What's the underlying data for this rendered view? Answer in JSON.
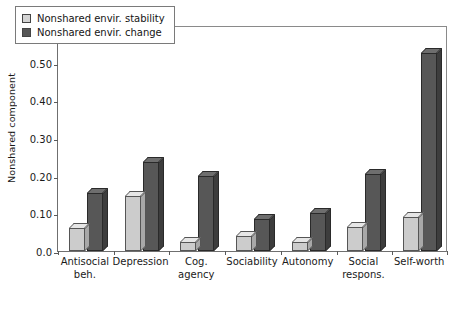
{
  "chart_data": {
    "type": "bar",
    "title": "",
    "xlabel": "",
    "ylabel": "Nonshared component",
    "ylim": [
      0.0,
      0.6
    ],
    "yticks": [
      "0.0",
      "0.10",
      "0.20",
      "0.30",
      "0.40",
      "0.50",
      "0.60"
    ],
    "ytick_values": [
      0.0,
      0.1,
      0.2,
      0.3,
      0.4,
      0.5,
      0.6
    ],
    "grid": false,
    "legend_position": "top-left",
    "categories": [
      "Antisocial beh.",
      "Depression",
      "Cog. agency",
      "Sociability",
      "Autonomy",
      "Social respons.",
      "Self-worth"
    ],
    "category_lines": [
      [
        "Antisocial",
        "beh."
      ],
      [
        "Depression",
        ""
      ],
      [
        "Cog.",
        "agency"
      ],
      [
        "Sociability",
        ""
      ],
      [
        "Autonomy",
        ""
      ],
      [
        "Social",
        "respons."
      ],
      [
        "Self-worth",
        ""
      ]
    ],
    "series": [
      {
        "name": "Nonshared envir. stability",
        "color": "#cccccc",
        "values": [
          0.06,
          0.145,
          0.025,
          0.04,
          0.025,
          0.065,
          0.09
        ]
      },
      {
        "name": "Nonshared envir. change",
        "color": "#575757",
        "values": [
          0.155,
          0.235,
          0.2,
          0.085,
          0.1,
          0.205,
          0.525
        ]
      }
    ]
  },
  "legend": {
    "items": [
      {
        "label": "Nonshared envir. stability",
        "swatch": "light"
      },
      {
        "label": "Nonshared envir. change",
        "swatch": "dark"
      }
    ]
  }
}
